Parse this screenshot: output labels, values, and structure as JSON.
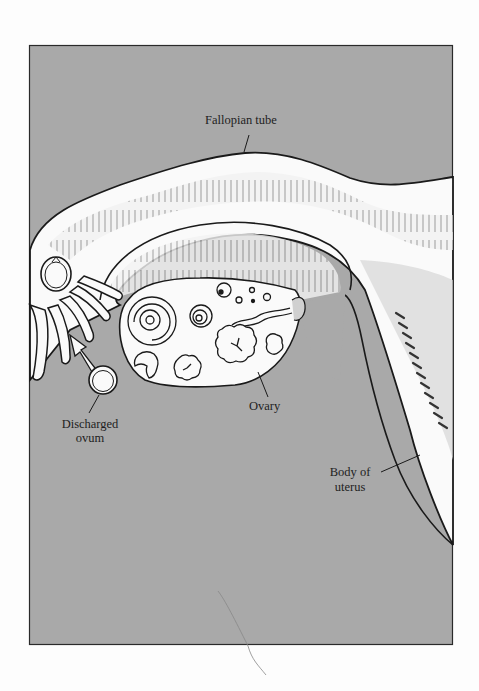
{
  "figure": {
    "background_color": "#a9a9a9",
    "tissue_color": "#fafafa",
    "frame_color": "#2a2a2a"
  },
  "labels": {
    "fallopian_tube": "Fallopian tube",
    "ovary": "Ovary",
    "discharged_ovum_line1": "Discharged",
    "discharged_ovum_line2": "ovum",
    "body_of_uterus_line1": "Body of",
    "body_of_uterus_line2": "uterus"
  }
}
